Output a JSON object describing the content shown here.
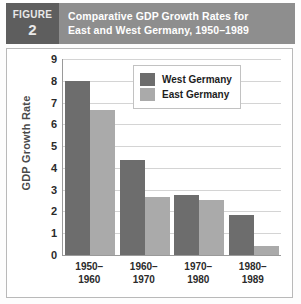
{
  "figure": {
    "badge_word": "FIGURE",
    "badge_number": "2",
    "title_line1": "Comparative GDP Growth Rates for",
    "title_line2": "East and West Germany, 1950–1989",
    "header_bg": "#8e8e8e",
    "badge_bg": "#5e5e5e"
  },
  "chart_data": {
    "type": "bar",
    "title": "Comparative GDP Growth Rates for East and West Germany, 1950–1989",
    "xlabel": "",
    "ylabel": "GDP Growth Rate",
    "categories": [
      "1950–1960",
      "1960–1970",
      "1970–1980",
      "1980–1989"
    ],
    "category_lines": [
      [
        "1950–",
        "1960"
      ],
      [
        "1960–",
        "1970"
      ],
      [
        "1970–",
        "1980"
      ],
      [
        "1980–",
        "1989"
      ]
    ],
    "series": [
      {
        "name": "West Germany",
        "color": "#6d6d6d",
        "values": [
          8.0,
          4.35,
          2.75,
          1.82
        ]
      },
      {
        "name": "East Germany",
        "color": "#aaaaaa",
        "values": [
          6.65,
          2.67,
          2.52,
          0.4
        ]
      }
    ],
    "ylim": [
      0,
      9
    ],
    "yticks": [
      0,
      1,
      2,
      3,
      4,
      5,
      6,
      7,
      8,
      9
    ],
    "ytick_labels": [
      "0",
      "1",
      "2",
      "3",
      "4",
      "5",
      "6",
      "7",
      "8",
      "9"
    ],
    "grid": true,
    "legend_position": "top-center"
  }
}
